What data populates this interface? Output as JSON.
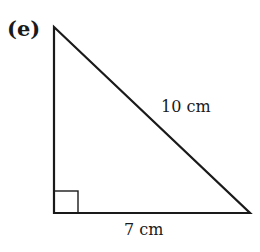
{
  "figure": {
    "part_label": "(e)",
    "shape": "right triangle",
    "hypotenuse_label": "10 cm",
    "base_label": "7 cm",
    "right_angle_marker": "bottom-left",
    "stroke_color": "#1a1a1a"
  }
}
